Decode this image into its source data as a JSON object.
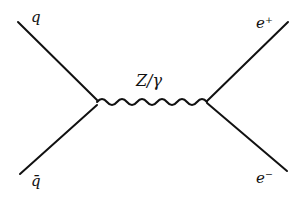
{
  "diagram": {
    "type": "feynman",
    "title": "",
    "labels": {
      "incoming_quark": "q",
      "incoming_antiquark": "q̄",
      "propagator": "Z/γ",
      "outgoing_positron": "e⁺",
      "outgoing_electron": "e⁻"
    },
    "vertices": [
      {
        "id": "v1",
        "x": 97,
        "y": 102
      },
      {
        "id": "v2",
        "x": 207,
        "y": 102
      }
    ],
    "edges": [
      {
        "from": "q",
        "to": "v1",
        "style": "fermion"
      },
      {
        "from": "q̄",
        "to": "v1",
        "style": "fermion"
      },
      {
        "from": "v1",
        "to": "v2",
        "style": "boson-wavy",
        "label": "Z/γ"
      },
      {
        "from": "v2",
        "to": "e⁺",
        "style": "fermion"
      },
      {
        "from": "v2",
        "to": "e⁻",
        "style": "fermion"
      }
    ],
    "stroke_color": "#111111",
    "background": "#ffffff"
  }
}
